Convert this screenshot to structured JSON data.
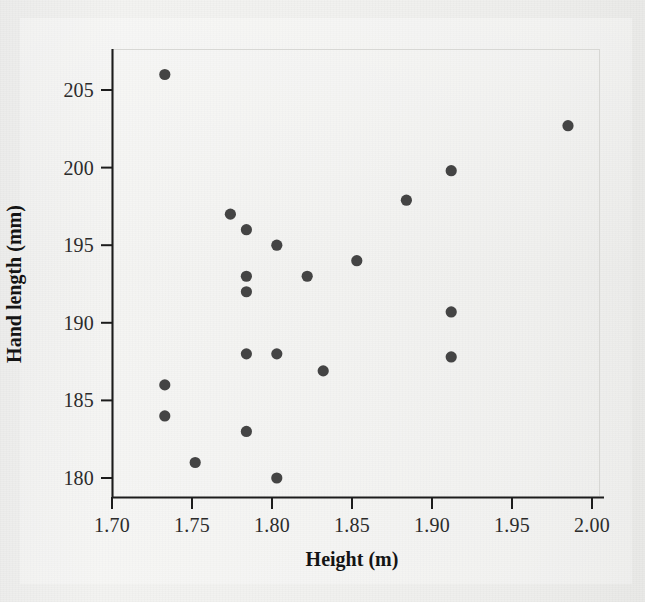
{
  "chart_data": {
    "type": "scatter",
    "title": "",
    "xlabel": "Height (m)",
    "ylabel": "Hand length (mm)",
    "xlim": [
      1.695,
      2.005
    ],
    "ylim": [
      178.8,
      207.2
    ],
    "grid": false,
    "legend": null,
    "marker_color": "#444444",
    "axis_color": "#1a1a1a",
    "background_color": "#f1f1ef",
    "xticks": [
      "1.70",
      "1.75",
      "1.80",
      "1.85",
      "1.90",
      "1.95",
      "2.00"
    ],
    "xtick_values": [
      1.7,
      1.75,
      1.8,
      1.85,
      1.9,
      1.95,
      2.0
    ],
    "yticks": [
      "180",
      "185",
      "190",
      "195",
      "200",
      "205"
    ],
    "ytick_values": [
      180,
      185,
      190,
      195,
      200,
      205
    ],
    "x": [
      1.733,
      1.985,
      1.912,
      1.884,
      1.774,
      1.784,
      1.803,
      1.853,
      1.822,
      1.784,
      1.784,
      1.912,
      1.784,
      1.803,
      1.912,
      1.832,
      1.733,
      1.733,
      1.784,
      1.752,
      1.803
    ],
    "y": [
      206.0,
      202.7,
      199.8,
      197.9,
      197.0,
      196.0,
      195.0,
      194.0,
      193.0,
      193.0,
      192.0,
      190.7,
      188.0,
      188.0,
      187.8,
      186.9,
      186.0,
      184.0,
      183.0,
      181.0,
      180.0
    ],
    "points": [
      {
        "x": 1.733,
        "y": 206.0
      },
      {
        "x": 1.985,
        "y": 202.7
      },
      {
        "x": 1.912,
        "y": 199.8
      },
      {
        "x": 1.884,
        "y": 197.9
      },
      {
        "x": 1.774,
        "y": 197.0
      },
      {
        "x": 1.784,
        "y": 196.0
      },
      {
        "x": 1.803,
        "y": 195.0
      },
      {
        "x": 1.853,
        "y": 194.0
      },
      {
        "x": 1.822,
        "y": 193.0
      },
      {
        "x": 1.784,
        "y": 193.0
      },
      {
        "x": 1.784,
        "y": 192.0
      },
      {
        "x": 1.912,
        "y": 190.7
      },
      {
        "x": 1.784,
        "y": 188.0
      },
      {
        "x": 1.803,
        "y": 188.0
      },
      {
        "x": 1.912,
        "y": 187.8
      },
      {
        "x": 1.832,
        "y": 186.9
      },
      {
        "x": 1.733,
        "y": 186.0
      },
      {
        "x": 1.733,
        "y": 184.0
      },
      {
        "x": 1.784,
        "y": 183.0
      },
      {
        "x": 1.752,
        "y": 181.0
      },
      {
        "x": 1.803,
        "y": 180.0
      }
    ]
  },
  "axes": {
    "x_title": "Height (m)",
    "y_title": "Hand length (mm)"
  }
}
